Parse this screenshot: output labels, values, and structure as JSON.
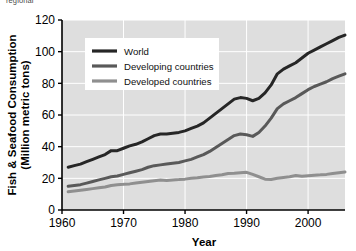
{
  "caption_fragment": "regional",
  "chart_data": {
    "type": "line",
    "title": "",
    "xlabel": "Year",
    "ylabel": "Fish & Seafood Consumption (Million metric tons)",
    "ylabel_line1": "Fish & Seafood Consumption",
    "ylabel_line2": "(Million metric tons)",
    "xlim": [
      1960,
      2006
    ],
    "ylim": [
      0,
      120
    ],
    "xticks": [
      1960,
      1970,
      1980,
      1990,
      2000
    ],
    "yticks": [
      0,
      20,
      40,
      60,
      80,
      100,
      120
    ],
    "xtick_labels": [
      "1960",
      "1970",
      "1980",
      "1990",
      "2000"
    ],
    "ytick_labels": [
      "0",
      "20",
      "40",
      "60",
      "80",
      "100",
      "120"
    ],
    "grid": true,
    "grid_color": "#ffffff",
    "plot_background": "#dedede",
    "legend_position": "upper-left-inside",
    "legend_background": "#ffffff",
    "x": [
      1961,
      1962,
      1963,
      1964,
      1965,
      1966,
      1967,
      1968,
      1969,
      1970,
      1971,
      1972,
      1973,
      1974,
      1975,
      1976,
      1977,
      1978,
      1979,
      1980,
      1981,
      1982,
      1983,
      1984,
      1985,
      1986,
      1987,
      1988,
      1989,
      1990,
      1991,
      1992,
      1993,
      1994,
      1995,
      1996,
      1997,
      1998,
      1999,
      2000,
      2001,
      2002,
      2003,
      2004,
      2005,
      2006
    ],
    "series": [
      {
        "name": "World",
        "color": "#262626",
        "line_width": 3.0,
        "values": [
          27,
          28,
          29,
          30.5,
          32,
          33.5,
          35,
          37.5,
          37.5,
          39,
          40.5,
          41.5,
          43,
          45,
          47,
          48,
          48,
          48.5,
          49,
          50,
          51.5,
          53,
          55,
          58,
          61,
          64,
          67,
          70,
          71,
          70.5,
          69,
          70.5,
          74,
          79,
          86,
          89,
          91,
          93,
          96,
          99,
          101,
          103,
          105,
          107,
          109,
          110.5
        ]
      },
      {
        "name": "Developing countries",
        "color": "#595959",
        "line_width": 3.0,
        "values": [
          15,
          15.5,
          16,
          17,
          18,
          19,
          20,
          21,
          21.5,
          22.5,
          23.5,
          24.5,
          25.5,
          27,
          28,
          28.5,
          29,
          29.5,
          30,
          31,
          32,
          33.5,
          35,
          37,
          39.5,
          42,
          44.5,
          47,
          48,
          47.5,
          46.5,
          49,
          53,
          58,
          64,
          67,
          69,
          71,
          73.5,
          76,
          78,
          79.5,
          81,
          83,
          84.5,
          86
        ]
      },
      {
        "name": "Developed countries",
        "color": "#8f8f8f",
        "line_width": 3.0,
        "values": [
          11.5,
          12,
          12.5,
          13,
          13.5,
          14,
          14.5,
          15.5,
          16,
          16.2,
          16.5,
          17,
          17.5,
          18,
          18.5,
          19,
          18.7,
          19,
          19.2,
          19.5,
          20,
          20.3,
          20.8,
          21.2,
          21.8,
          22.3,
          23,
          23.2,
          23.5,
          23.8,
          22.5,
          21,
          19.5,
          19.3,
          20,
          20.5,
          21,
          21.8,
          21.3,
          21.7,
          22,
          22.2,
          22.5,
          23,
          23.5,
          24
        ]
      }
    ]
  },
  "legend": {
    "items": [
      {
        "label": "World",
        "color": "#262626"
      },
      {
        "label": "Developing countries",
        "color": "#595959"
      },
      {
        "label": "Developed countries",
        "color": "#8f8f8f"
      }
    ]
  }
}
